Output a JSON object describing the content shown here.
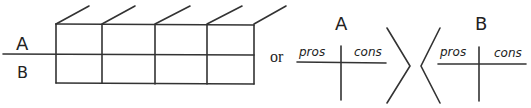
{
  "diagram": {
    "colors": {
      "stroke": "#333333",
      "text": "#222222",
      "background": "#ffffff"
    },
    "left_grid": {
      "row_labels": [
        "A",
        "B"
      ],
      "columns": 4,
      "rows": 2
    },
    "connector": "or",
    "right_tables": [
      {
        "title": "A",
        "left_header": "pros",
        "right_header": "cons"
      },
      {
        "title": "B",
        "left_header": "pros",
        "right_header": "cons"
      }
    ]
  }
}
